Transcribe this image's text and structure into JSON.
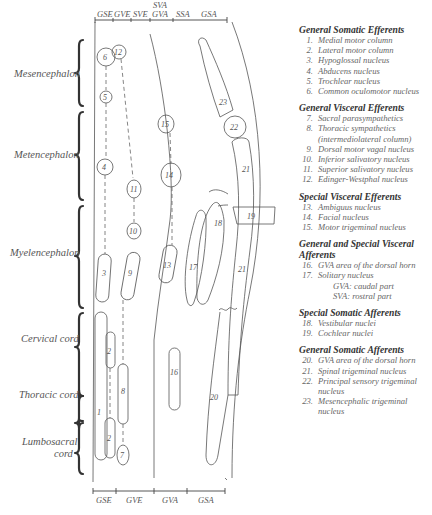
{
  "diagram": {
    "top_columns": [
      {
        "label": "GSE",
        "x": 107
      },
      {
        "label": "GVE",
        "x": 126
      },
      {
        "label": "SVE",
        "x": 144
      },
      {
        "label": "GVA",
        "x": 163
      },
      {
        "label": "SSA",
        "x": 184
      },
      {
        "label": "GSA",
        "x": 209
      }
    ],
    "top_extra_label": {
      "label": "SVA",
      "x": 163
    },
    "bottom_columns": [
      {
        "label": "GSE",
        "x": 105
      },
      {
        "label": "GVE",
        "x": 131
      },
      {
        "label": "GVA",
        "x": 168
      },
      {
        "label": "GSA",
        "x": 206
      }
    ],
    "regions": [
      {
        "label": "Mesencephalon",
        "y1": 40,
        "y2": 106
      },
      {
        "label": "Metencephalon",
        "y1": 112,
        "y2": 200
      },
      {
        "label": "Myelencephalon",
        "y1": 206,
        "y2": 308
      },
      {
        "label": "Cervical cord",
        "y1": 313,
        "y2": 396
      },
      {
        "label": "Thoracic cord",
        "y1": 398,
        "y2": 421
      },
      {
        "label": "Lumbosacral cord",
        "y1": 423,
        "y2": 474
      }
    ],
    "nuclei_labels": {
      "n1": "1",
      "n2a": "2",
      "n2b": "2",
      "n3": "3",
      "n4": "4",
      "n5": "5",
      "n6": "6",
      "n7": "7",
      "n8": "8",
      "n9": "9",
      "n10": "10",
      "n11": "11",
      "n12": "12",
      "n13": "13",
      "n14": "14",
      "n15": "15",
      "n16": "16",
      "n17": "17",
      "n18": "18",
      "n19": "19",
      "n20": "20",
      "n21a": "21",
      "n21b": "21",
      "n22": "22",
      "n23": "23"
    }
  },
  "legend": {
    "groups": [
      {
        "title": "General Somatic Efferents",
        "items": [
          {
            "n": "1.",
            "t": "Medial motor column"
          },
          {
            "n": "2.",
            "t": "Lateral motor column"
          },
          {
            "n": "3.",
            "t": "Hypoglossal nucleus"
          },
          {
            "n": "4.",
            "t": "Abducens nucleus"
          },
          {
            "n": "5.",
            "t": "Trochlear nucleus"
          },
          {
            "n": "6.",
            "t": "Common oculomotor nucleus"
          }
        ]
      },
      {
        "title": "General Visceral Efferents",
        "items": [
          {
            "n": "7.",
            "t": "Sacral parasympathetics"
          },
          {
            "n": "8.",
            "t": "Thoracic sympathetics (intermediolateral column)"
          },
          {
            "n": "9.",
            "t": "Dorsal motor vagal nucleus"
          },
          {
            "n": "10.",
            "t": "Inferior salivatory nucleus"
          },
          {
            "n": "11.",
            "t": "Superior salivatory nucleus"
          },
          {
            "n": "12.",
            "t": "Edinger-Westphal nucleus"
          }
        ]
      },
      {
        "title": "Special Visceral Efferents",
        "items": [
          {
            "n": "13.",
            "t": "Ambiguus nucleus"
          },
          {
            "n": "14.",
            "t": "Facial nucleus"
          },
          {
            "n": "15.",
            "t": "Motor trigeminal nucleus"
          }
        ]
      },
      {
        "title": "General and Special Visceral Afferents",
        "items": [
          {
            "n": "16.",
            "t": "GVA area of the dorsal horn"
          },
          {
            "n": "17.",
            "t": "Solitary nucleus"
          }
        ],
        "subs": [
          "GVA: caudal part",
          "SVA: rostral part"
        ]
      },
      {
        "title": "Special Somatic Afferents",
        "items": [
          {
            "n": "18.",
            "t": "Vestibular nuclei"
          },
          {
            "n": "19.",
            "t": "Cochlear nuclei"
          }
        ]
      },
      {
        "title": "General Somatic Afferents",
        "items": [
          {
            "n": "20.",
            "t": "GVA area of the dorsal horn"
          },
          {
            "n": "21.",
            "t": "Spinal trigeminal nucleus"
          },
          {
            "n": "22.",
            "t": "Principal sensory trigeminal nucleus"
          },
          {
            "n": "23.",
            "t": "Mesencephalic trigeminal nucleus"
          }
        ]
      }
    ]
  }
}
